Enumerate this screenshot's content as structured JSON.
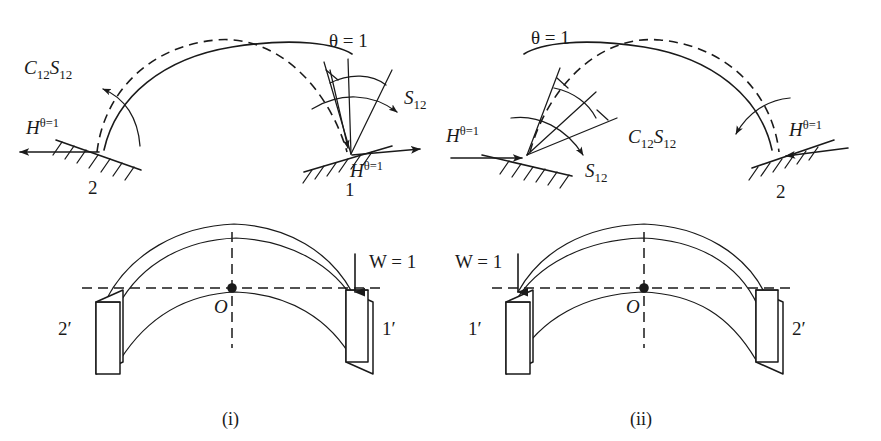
{
  "figure": {
    "panels": [
      {
        "id": "i",
        "caption": "(i)",
        "description": "Unit rotation theta = 1 applied at support 1 of fixed arch; reactions S12 at near end and C12 S12 carried over to far end 2.",
        "labels": {
          "near_node": "1",
          "far_node": "2",
          "rotation": "θ = 1",
          "moment_near": "S",
          "moment_near_sub": "12",
          "moment_far_coef": "C",
          "moment_far_coef_sub": "12",
          "moment_far": "S",
          "moment_far_sub": "12",
          "thrust": "H",
          "thrust_sup": "θ=1"
        }
      },
      {
        "id": "ii",
        "caption": "(ii)",
        "description": "Mirror case: unit rotation theta = 1 applied at left support 1; moment S12 at left, carry-over C12 S12 at right support 2.",
        "labels": {
          "near_node": "1",
          "far_node": "2",
          "rotation": "θ = 1",
          "moment_near": "S",
          "moment_near_sub": "12",
          "moment_far_coef": "C",
          "moment_far_coef_sub": "12",
          "moment_far": "S",
          "moment_far_sub": "12",
          "thrust": "H",
          "thrust_sup": "θ=1"
        }
      }
    ],
    "arch_views": [
      {
        "id": "i-arch",
        "left_abutment_label": "2′",
        "right_abutment_label": "1′",
        "centroid_label": "O",
        "load_label": "W = 1",
        "load_side": "right"
      },
      {
        "id": "ii-arch",
        "left_abutment_label": "1′",
        "right_abutment_label": "2′",
        "centroid_label": "O",
        "load_label": "W = 1",
        "load_side": "left"
      }
    ],
    "colors": {
      "ink": "#1a1a1a",
      "paper": "#ffffff"
    }
  }
}
